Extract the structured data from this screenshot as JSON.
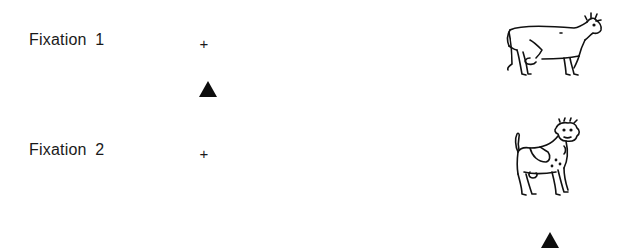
{
  "figure": {
    "panels": [
      {
        "label": "Fixation  1",
        "fixation_symbol": "+",
        "target_marker": "triangle",
        "target_position": "below-fixation",
        "picture": "cow-side-view"
      },
      {
        "label": "Fixation  2",
        "fixation_symbol": "+",
        "target_marker": "triangle",
        "target_position": "below-picture",
        "picture": "cow-three-quarter-view"
      }
    ],
    "colors": {
      "background": "#ffffff",
      "ink": "#111111"
    }
  }
}
